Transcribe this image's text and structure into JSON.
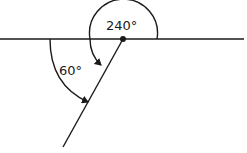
{
  "diagram": {
    "labels": {
      "large_angle": "240°",
      "small_angle": "60°"
    },
    "colors": {
      "stroke": "#1a1a1a",
      "background": "#ffffff"
    }
  }
}
